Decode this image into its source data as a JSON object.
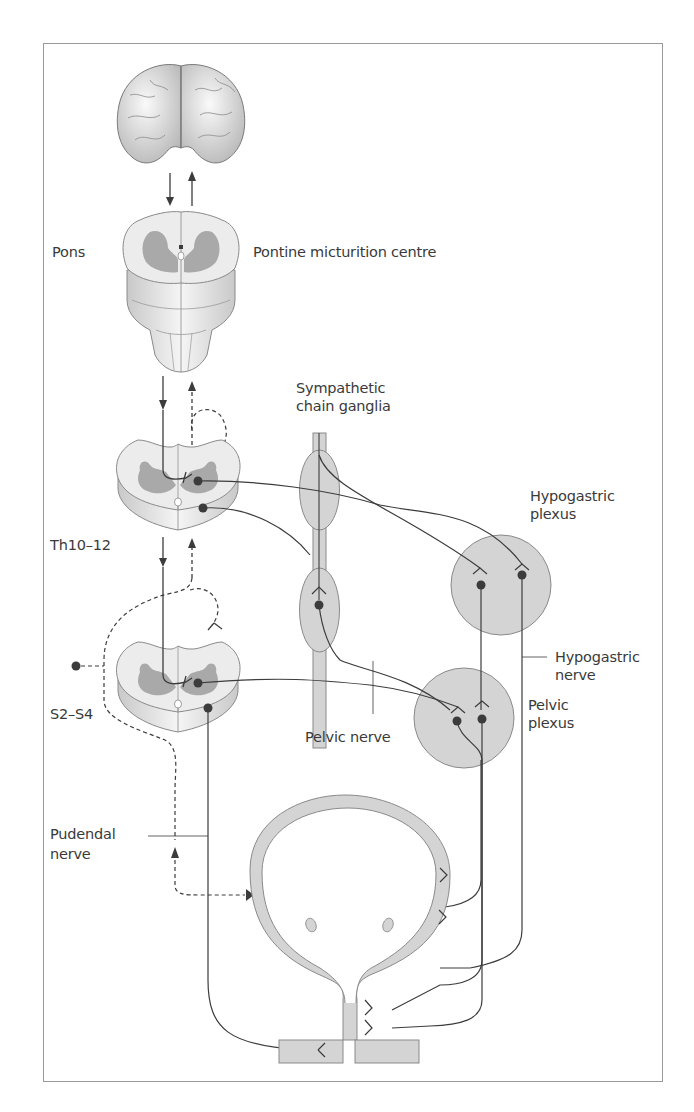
{
  "diagram": {
    "labels": {
      "pons": "Pons",
      "pontine_centre": "Pontine micturition centre",
      "sympathetic_line1": "Sympathetic",
      "sympathetic_line2": "chain ganglia",
      "hypogastric_plexus_line1": "Hypogastric",
      "hypogastric_plexus_line2": "plexus",
      "th": "Th10–12",
      "hypogastric_nerve_line1": "Hypogastric",
      "hypogastric_nerve_line2": "nerve",
      "s2s4": "S2–S4",
      "pelvic_nerve": "Pelvic nerve",
      "pelvic_plexus_line1": "Pelvic",
      "pelvic_plexus_line2": "plexus",
      "pudendal_line1": "Pudendal",
      "pudendal_line2": "nerve"
    },
    "structures": [
      "brain",
      "pons",
      "thoracic-spinal-segment",
      "sacral-spinal-segment",
      "sympathetic-chain-ganglia",
      "hypogastric-plexus",
      "pelvic-plexus",
      "bladder",
      "external-sphincter"
    ],
    "colors": {
      "fill_grey": "#d4d4d4",
      "grey_matter": "#a9a9a9",
      "white_matter": "#ececec",
      "line": "#3c3c3c",
      "frame": "#9a9a9a"
    }
  }
}
